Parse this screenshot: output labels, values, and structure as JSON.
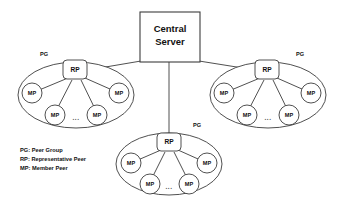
{
  "diagram": {
    "background_color": "#ffffff",
    "stroke_color": "#3c3c3c",
    "text_color": "#111111",
    "server": {
      "line1": "Central",
      "line2": "Server"
    },
    "group_label": "PG",
    "rp_label": "RP",
    "mp_label": "MP",
    "ellipsis": "...",
    "groups": [
      {
        "name": "left-peer-group",
        "pg_label": "PG",
        "rp": {
          "label": "RP"
        },
        "members": [
          {
            "label": "MP"
          },
          {
            "label": "MP"
          },
          {
            "label": "MP"
          },
          {
            "label": "MP"
          }
        ],
        "ellipsis": "..."
      },
      {
        "name": "right-peer-group",
        "pg_label": "PG",
        "rp": {
          "label": "RP"
        },
        "members": [
          {
            "label": "MP"
          },
          {
            "label": "MP"
          },
          {
            "label": "MP"
          },
          {
            "label": "MP"
          }
        ],
        "ellipsis": "..."
      },
      {
        "name": "bottom-peer-group",
        "pg_label": "PG",
        "rp": {
          "label": "RP"
        },
        "members": [
          {
            "label": "MP"
          },
          {
            "label": "MP"
          },
          {
            "label": "MP"
          },
          {
            "label": "MP"
          }
        ],
        "ellipsis": "..."
      }
    ],
    "legend": {
      "lines": [
        "PG: Peer Group",
        "RP: Representative Peer",
        "MP: Member Peer"
      ]
    }
  }
}
